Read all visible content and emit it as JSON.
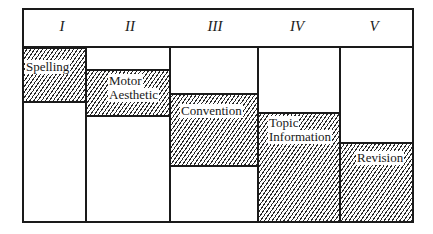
{
  "diagram": {
    "columns": [
      {
        "numeral": "I"
      },
      {
        "numeral": "II"
      },
      {
        "numeral": "III"
      },
      {
        "numeral": "IV"
      },
      {
        "numeral": "V"
      }
    ],
    "blocks": [
      {
        "column": "I",
        "label_lines": [
          "Spelling"
        ]
      },
      {
        "column": "II",
        "label_lines": [
          "Motor",
          "Aesthetic"
        ]
      },
      {
        "column": "III",
        "label_lines": [
          "Convention"
        ]
      },
      {
        "column": "IV",
        "label_lines": [
          "Topic",
          "Information"
        ]
      },
      {
        "column": "V",
        "label_lines": [
          "Revision"
        ]
      }
    ],
    "colors": {
      "line": "#1a1a1a",
      "background": "#ffffff"
    }
  }
}
